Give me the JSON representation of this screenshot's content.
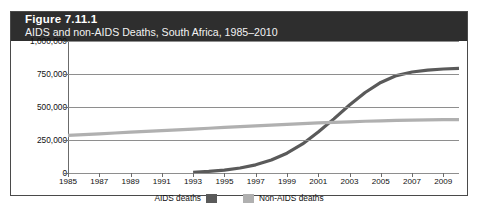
{
  "figure": {
    "title": "Figure 7.11.1",
    "subtitle": "AIDS and non-AIDS Deaths, South Africa, 1985–2010"
  },
  "colors": {
    "header_background": "#2e2e2e",
    "header_text": "#ffffff",
    "aids_series": "#5a5a5a",
    "non_aids_series": "#b0b0b0",
    "gridline": "#8e8e8e",
    "border": "#4a4a4a"
  },
  "legend": {
    "position": "bottom-center",
    "entries": [
      {
        "label": "AIDS deaths",
        "color": "#5a5a5a",
        "swatch_side": "right"
      },
      {
        "label": "Non-AIDS deaths",
        "color": "#b0b0b0",
        "swatch_side": "left"
      }
    ]
  },
  "chart_data": {
    "type": "line",
    "title": "AIDS and non-AIDS Deaths, South Africa, 1985–2010",
    "xlabel": "",
    "ylabel": "",
    "xlim": [
      1985,
      2010
    ],
    "ylim": [
      0,
      1000000
    ],
    "grid": true,
    "y_ticks": [
      0,
      250000,
      500000,
      750000,
      1000000
    ],
    "y_tick_labels": [
      "0",
      "250,000",
      "500,000",
      "750,000",
      "1,000,000"
    ],
    "x_ticks": [
      1985,
      1987,
      1989,
      1991,
      1993,
      1995,
      1997,
      1999,
      2001,
      2003,
      2005,
      2007,
      2009
    ],
    "x_tick_labels": [
      "1985",
      "1987",
      "1989",
      "1991",
      "1993",
      "1995",
      "1997",
      "1999",
      "2001",
      "2003",
      "2005",
      "2007",
      "2009"
    ],
    "series": [
      {
        "name": "AIDS deaths",
        "color": "#5a5a5a",
        "x": [
          1993,
          1994,
          1995,
          1996,
          1997,
          1998,
          1999,
          2000,
          2001,
          2002,
          2003,
          2004,
          2005,
          2006,
          2007,
          2008,
          2009,
          2010
        ],
        "values": [
          5000,
          12000,
          22000,
          38000,
          62000,
          98000,
          150000,
          220000,
          310000,
          410000,
          515000,
          610000,
          686000,
          738000,
          765000,
          780000,
          788000,
          792000
        ]
      },
      {
        "name": "Non-AIDS deaths",
        "color": "#b0b0b0",
        "x": [
          1985,
          1986,
          1987,
          1988,
          1989,
          1990,
          1991,
          1992,
          1993,
          1994,
          1995,
          1996,
          1997,
          1998,
          1999,
          2000,
          2001,
          2002,
          2003,
          2004,
          2005,
          2006,
          2007,
          2008,
          2009,
          2010
        ],
        "values": [
          285000,
          291000,
          297000,
          303000,
          309000,
          315000,
          321000,
          327000,
          333000,
          339000,
          345000,
          351000,
          357000,
          363000,
          369000,
          374000,
          379000,
          384000,
          388000,
          392000,
          395000,
          398000,
          400000,
          402000,
          404000,
          405000
        ]
      }
    ]
  }
}
